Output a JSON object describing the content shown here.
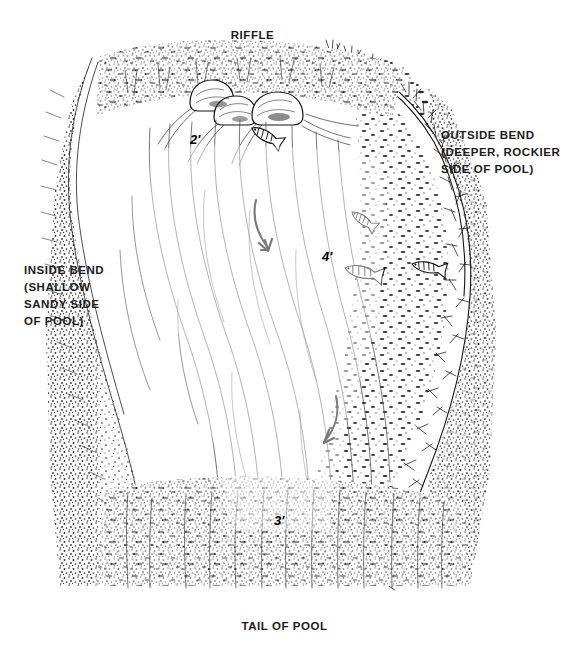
{
  "diagram": {
    "type": "pen-and-ink illustration",
    "background_color": "#ffffff",
    "ink_color": "#1b1b1b"
  },
  "labels": {
    "riffle": "RIFFLE",
    "tail_of_pool": "TAIL OF POOL",
    "outside_bend": "OUTSIDE BEND\n(DEEPER, ROCKIER\nSIDE OF POOL)",
    "inside_bend": "INSIDE BEND\n(SHALLOW\nSANDY SIDE\nOF POOL)"
  },
  "depth_markers": {
    "riffle_depth": "2'",
    "outside_bend_depth": "4'",
    "tail_depth": "3'"
  },
  "features": {
    "boulder_count": 3,
    "fish_count": 4,
    "current_arrow_count": 2,
    "left_bank": "sandy stipple",
    "right_bank": "rocky with grass"
  }
}
